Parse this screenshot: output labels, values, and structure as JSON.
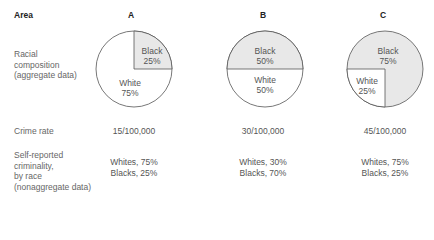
{
  "header": {
    "area_label": "Area",
    "columns": [
      "A",
      "B",
      "C"
    ]
  },
  "rows": {
    "racial_composition": {
      "label_lines": [
        "Racial",
        "composition",
        "(aggregate data)"
      ]
    },
    "crime_rate": {
      "label": "Crime rate",
      "values": [
        "15/100,000",
        "30/100,000",
        "45/100,000"
      ]
    },
    "self_reported": {
      "label_lines": [
        "Self-reported",
        "criminality,",
        "by race",
        "(nonaggregate data)"
      ],
      "values": [
        {
          "whites": "Whites, 75%",
          "blacks": "Blacks, 25%"
        },
        {
          "whites": "Whites, 30%",
          "blacks": "Blacks, 70%"
        },
        {
          "whites": "Whites, 75%",
          "blacks": "Blacks, 25%"
        }
      ]
    }
  },
  "pies": [
    {
      "black_label": "Black",
      "black_pct": "25%",
      "white_label": "White",
      "white_pct": "75%"
    },
    {
      "black_label": "Black",
      "black_pct": "50%",
      "white_label": "White",
      "white_pct": "50%"
    },
    {
      "black_label": "Black",
      "black_pct": "75%",
      "white_label": "White",
      "white_pct": "25%"
    }
  ],
  "colors": {
    "black_fill": "#e8e8e8",
    "white_fill": "#ffffff",
    "stroke": "#555555"
  }
}
